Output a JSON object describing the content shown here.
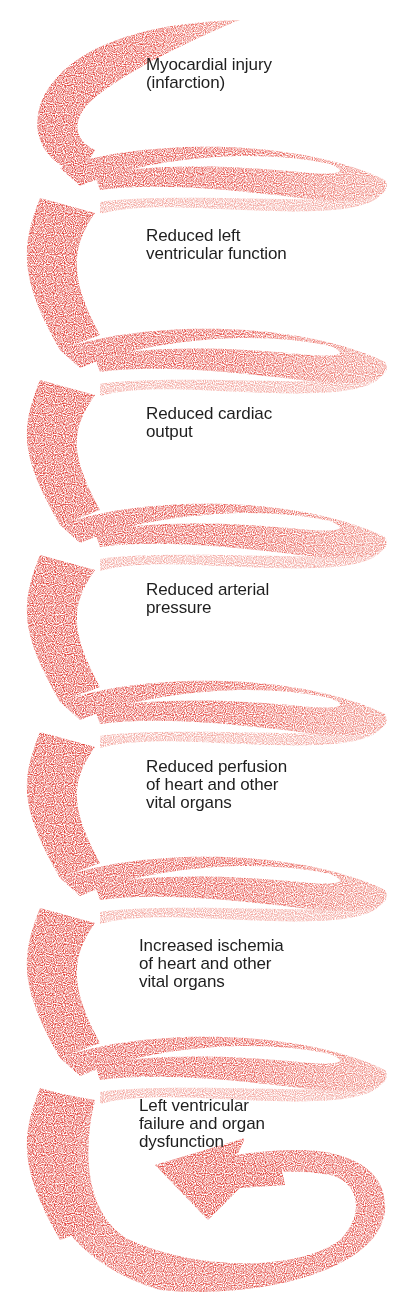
{
  "diagram": {
    "type": "downward-spiral",
    "colors": {
      "ribbon": "#e2443c",
      "ribbon_light": "#ef8a80",
      "text": "#1e1e1e",
      "background": "#ffffff"
    },
    "steps": [
      {
        "label": "Myocardial injury\n(infarction)",
        "x": 146,
        "y": 56
      },
      {
        "label": "Reduced left\nventricular function",
        "x": 146,
        "y": 227
      },
      {
        "label": "Reduced cardiac\noutput",
        "x": 146,
        "y": 405
      },
      {
        "label": "Reduced arterial\npressure",
        "x": 146,
        "y": 581
      },
      {
        "label": "Reduced perfusion\nof heart and other\nvital organs",
        "x": 146,
        "y": 758
      },
      {
        "label": "Increased ischemia\nof heart and other\nvital organs",
        "x": 139,
        "y": 937
      },
      {
        "label": "Left ventricular\nfailure and organ\ndysfunction",
        "x": 139,
        "y": 1097
      }
    ],
    "arrow": {
      "direction": "left",
      "position": "bottom"
    }
  }
}
